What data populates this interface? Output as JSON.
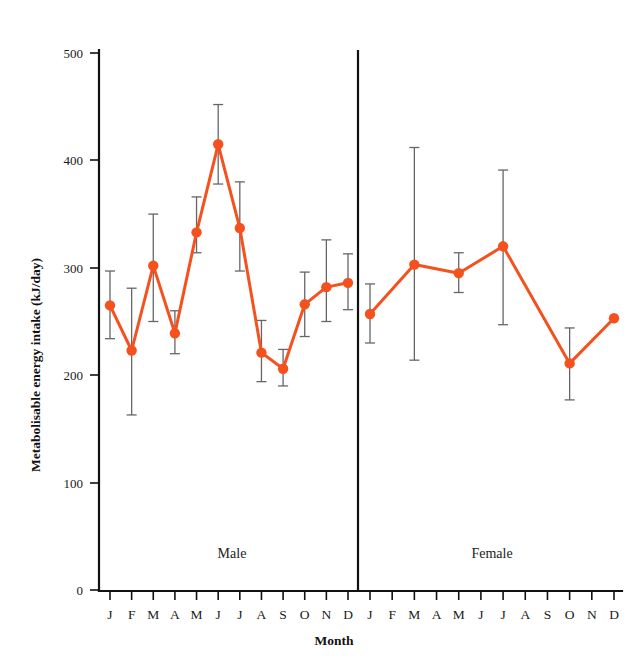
{
  "figure": {
    "background": "#ffffff",
    "accent_color": "#F4511E",
    "error_bar_color": "#666666",
    "axis_color": "#111111"
  },
  "chart_data": {
    "type": "line",
    "title": "",
    "xlabel": "Month",
    "ylabel": "Metabolisable energy intake (kJ/day)",
    "ylim": [
      0,
      500
    ],
    "ytick_values": [
      0,
      100,
      200,
      300,
      400,
      500
    ],
    "ytick_labels": [
      "0",
      "100",
      "200",
      "300",
      "400",
      "500"
    ],
    "grid": false,
    "legend": "none",
    "categories": [
      "J",
      "F",
      "M",
      "A",
      "M",
      "J",
      "J",
      "A",
      "S",
      "O",
      "N",
      "D"
    ],
    "panels": [
      {
        "label": "Male",
        "x": [
          "J",
          "F",
          "M",
          "A",
          "M",
          "J",
          "J",
          "A",
          "S",
          "O",
          "N",
          "D"
        ],
        "values": [
          265,
          223,
          302,
          239,
          333,
          415,
          337,
          221,
          206,
          266,
          282,
          286
        ],
        "err_low": [
          234,
          163,
          250,
          220,
          314,
          378,
          297,
          194,
          190,
          236,
          250,
          261
        ],
        "err_high": [
          297,
          281,
          350,
          260,
          366,
          452,
          380,
          251,
          224,
          296,
          326,
          313
        ]
      },
      {
        "label": "Female",
        "x": [
          "J",
          "M",
          "M",
          "J",
          "O",
          "D"
        ],
        "values": [
          257,
          303,
          295,
          320,
          211,
          253
        ],
        "err_low": [
          230,
          214,
          277,
          247,
          177,
          253
        ],
        "err_high": [
          285,
          412,
          314,
          391,
          244,
          253
        ]
      }
    ]
  },
  "axes": {
    "y_title": "Metabolisable energy intake (kJ/day)",
    "x_title": "Month"
  },
  "panel_labels": {
    "left": "Male",
    "right": "Female"
  }
}
